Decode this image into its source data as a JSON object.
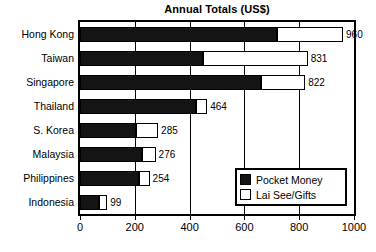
{
  "chart_data": {
    "type": "bar",
    "orientation": "horizontal",
    "stacked": true,
    "title": "Annual Totals (US$)",
    "xlabel": "",
    "ylabel": "",
    "xlim": [
      0,
      1000
    ],
    "xticks": [
      0,
      200,
      400,
      600,
      800,
      1000
    ],
    "grid": true,
    "grid_axis": "x",
    "legend_position": "lower right",
    "categories": [
      "Hong Kong",
      "Taiwan",
      "Singapore",
      "Thailand",
      "S. Korea",
      "Malaysia",
      "Philippines",
      "Indonesia"
    ],
    "series": [
      {
        "name": "Pocket Money",
        "color": "#141414",
        "values": [
          720,
          450,
          660,
          425,
          205,
          225,
          215,
          70
        ]
      },
      {
        "name": "Lai See/Gifts",
        "color": "#ffffff",
        "values": [
          240,
          381,
          162,
          39,
          80,
          51,
          39,
          29
        ]
      }
    ],
    "totals": [
      960,
      831,
      822,
      464,
      285,
      276,
      254,
      99
    ],
    "total_labels": [
      "960",
      "831",
      "822",
      "464",
      "285",
      "276",
      "254",
      "99"
    ]
  },
  "legend": {
    "items": [
      {
        "label": "Pocket Money",
        "swatch": "dark"
      },
      {
        "label": "Lai See/Gifts",
        "swatch": "light"
      }
    ]
  },
  "axis": {
    "x_tick_labels": [
      "0",
      "200",
      "400",
      "600",
      "800",
      "1000"
    ]
  }
}
